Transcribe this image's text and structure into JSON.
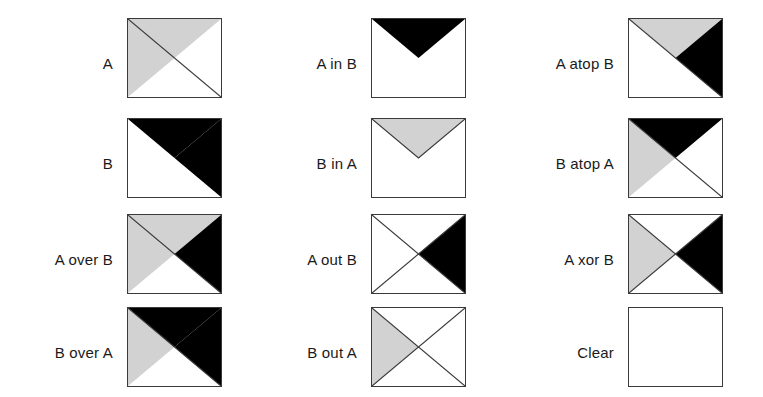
{
  "figure": {
    "colors": {
      "shape_a_fill": "#d2d2d2",
      "shape_b_fill": "#000000",
      "box_border": "#3a3a3a",
      "background": "#ffffff",
      "label_text": "#1a1a1a"
    },
    "legend": {
      "shape_a_description": "A is the upper-left gray triangle",
      "shape_b_description": "B is the upper-right black triangle"
    },
    "columns": [
      {
        "label_right_x": 113,
        "box_x": 127
      },
      {
        "label_right_x": 357,
        "box_x": 371
      },
      {
        "label_right_x": 614,
        "box_x": 628
      }
    ],
    "rows": [
      {
        "box_y": 18,
        "label_y": 56
      },
      {
        "box_y": 118,
        "label_y": 156
      },
      {
        "box_y": 214,
        "label_y": 252
      },
      {
        "box_y": 307,
        "label_y": 345
      }
    ],
    "box_width": 95,
    "box_height": 80,
    "cells": [
      {
        "name": "a",
        "label": "A",
        "col": 0,
        "row": 0,
        "regions": [
          {
            "region": "a-only",
            "fill": "shape_a_fill"
          },
          {
            "region": "intersection",
            "fill": "shape_a_fill"
          }
        ],
        "outlines": [
          "diag-main"
        ]
      },
      {
        "name": "b",
        "label": "B",
        "col": 0,
        "row": 1,
        "regions": [
          {
            "region": "b-only",
            "fill": "shape_b_fill"
          },
          {
            "region": "intersection",
            "fill": "shape_b_fill"
          }
        ],
        "outlines": []
      },
      {
        "name": "a-over-b",
        "label": "A over B",
        "col": 0,
        "row": 2,
        "regions": [
          {
            "region": "a-only",
            "fill": "shape_a_fill"
          },
          {
            "region": "intersection",
            "fill": "shape_a_fill"
          },
          {
            "region": "b-only",
            "fill": "shape_b_fill"
          }
        ],
        "outlines": [
          "diag-main"
        ]
      },
      {
        "name": "b-over-a",
        "label": "B over A",
        "col": 0,
        "row": 3,
        "regions": [
          {
            "region": "a-only",
            "fill": "shape_a_fill"
          },
          {
            "region": "intersection",
            "fill": "shape_b_fill"
          },
          {
            "region": "b-only",
            "fill": "shape_b_fill"
          }
        ],
        "outlines": [
          "diag-main"
        ]
      },
      {
        "name": "a-in-b",
        "label": "A in B",
        "col": 1,
        "row": 0,
        "regions": [
          {
            "region": "intersection",
            "fill": "shape_b_fill"
          }
        ],
        "outlines": []
      },
      {
        "name": "b-in-a",
        "label": "B in A",
        "col": 1,
        "row": 1,
        "regions": [
          {
            "region": "intersection",
            "fill": "shape_a_fill"
          }
        ],
        "outlines": [
          "intersection-outline"
        ]
      },
      {
        "name": "a-out-b",
        "label": "A out B",
        "col": 1,
        "row": 2,
        "regions": [
          {
            "region": "b-only",
            "fill": "shape_b_fill"
          }
        ],
        "outlines": [
          "diag-main",
          "diag-anti"
        ]
      },
      {
        "name": "b-out-a",
        "label": "B out A",
        "col": 1,
        "row": 3,
        "regions": [
          {
            "region": "a-only",
            "fill": "shape_a_fill"
          }
        ],
        "outlines": [
          "diag-main",
          "diag-anti"
        ]
      },
      {
        "name": "a-atop-b",
        "label": "A atop B",
        "col": 2,
        "row": 0,
        "regions": [
          {
            "region": "intersection",
            "fill": "shape_a_fill"
          },
          {
            "region": "b-only",
            "fill": "shape_b_fill"
          }
        ],
        "outlines": [
          "diag-main"
        ]
      },
      {
        "name": "b-atop-a",
        "label": "B atop A",
        "col": 2,
        "row": 1,
        "regions": [
          {
            "region": "a-only",
            "fill": "shape_a_fill"
          },
          {
            "region": "intersection",
            "fill": "shape_b_fill"
          }
        ],
        "outlines": [
          "diag-main"
        ]
      },
      {
        "name": "a-xor-b",
        "label": "A xor B",
        "col": 2,
        "row": 2,
        "regions": [
          {
            "region": "a-only",
            "fill": "shape_a_fill"
          },
          {
            "region": "b-only",
            "fill": "shape_b_fill"
          }
        ],
        "outlines": [
          "diag-main",
          "diag-anti"
        ]
      },
      {
        "name": "clear",
        "label": "Clear",
        "col": 2,
        "row": 3,
        "regions": [],
        "outlines": []
      }
    ]
  }
}
